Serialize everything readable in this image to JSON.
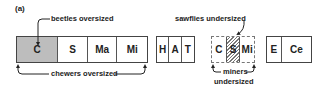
{
  "panel_label": "(a)",
  "groups": [
    {
      "id": "main",
      "style": "solid",
      "cells": [
        {
          "label": "C",
          "fill": "#bdbdbd"
        },
        {
          "label": "S",
          "fill": "#ffffff"
        },
        {
          "label": "Ma",
          "fill": "#ffffff"
        },
        {
          "label": "Mi",
          "fill": "#ffffff"
        }
      ]
    },
    {
      "id": "hat",
      "style": "solid",
      "cells": [
        {
          "label": "H"
        },
        {
          "label": "A"
        },
        {
          "label": "T"
        }
      ]
    },
    {
      "id": "csmi",
      "style": "dashed",
      "cells": [
        {
          "label": "C"
        },
        {
          "label": "S",
          "pattern": "hatched"
        },
        {
          "label": "Mi"
        }
      ]
    },
    {
      "id": "ece",
      "style": "solid",
      "cells": [
        {
          "label": "E"
        },
        {
          "label": "Ce"
        }
      ]
    }
  ],
  "annotations": {
    "beetles": "beetles oversized",
    "chewers": "chewers oversized",
    "sawflies": "sawflies undersized",
    "miners_line1": "miners",
    "miners_line2": "undersized"
  },
  "colors": {
    "shaded_fill": "#bdbdbd",
    "border": "#444444",
    "hatch": "#777777"
  }
}
